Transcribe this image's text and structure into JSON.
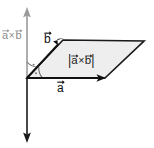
{
  "labels": {
    "axis_cross_product": {
      "a": "a",
      "times": "×",
      "b": "b",
      "text": "a×b"
    },
    "area_magnitude": {
      "bar_left": "|",
      "a": "a",
      "times": "×",
      "b": "b",
      "bar_right": "|",
      "text": "|a×b|"
    },
    "vector_b": {
      "symbol": "b",
      "text": "b"
    },
    "vector_a": {
      "symbol": "a",
      "text": "a"
    }
  },
  "colors": {
    "background": "#ffffff",
    "parallelogram_fill": "#eeeeee",
    "parallelogram_stroke": "#1a1a1a",
    "vector_stroke": "#111111",
    "axis_upper_gray": "#9a9a9a",
    "axis_lower_dark": "#1a1a1a",
    "angle_mark": "#6f6f6f",
    "axis_label_gray": "#8c8c8c"
  },
  "geometry": {
    "origin": {
      "x": 27,
      "y": 78
    },
    "vector_a_tip": {
      "x": 105,
      "y": 78
    },
    "vector_b_tip": {
      "x": 63,
      "y": 40
    },
    "parallelogram_far_corner": {
      "x": 144,
      "y": 41
    },
    "axis_top": {
      "x": 27,
      "y": 8
    },
    "axis_bottom": {
      "x": 27,
      "y": 142
    }
  },
  "marks": {
    "right_angle_upper": "arc-with-dot",
    "right_angle_lower": "arc-with-dot"
  }
}
